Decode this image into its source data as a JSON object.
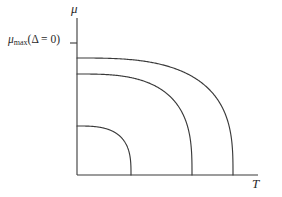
{
  "figure": {
    "background_color": "#ffffff",
    "line_color": "#3a3a3a"
  },
  "labels": {
    "y_axis": "μ",
    "x_axis": "T",
    "mu_max_symbol": "μ",
    "mu_max_subscript": "max",
    "mu_max_argument": "(Δ = 0)"
  },
  "chart_data": {
    "type": "line",
    "title": "",
    "xlabel": "T",
    "ylabel": "μ",
    "grid": false,
    "legend": null,
    "annotations": [
      {
        "text": "μ_max(Δ = 0)",
        "axis": "y",
        "value": 1.0,
        "tick": true
      }
    ],
    "axis": {
      "x_origin_px": 77,
      "y_origin_px": 175,
      "x_end_px": 258,
      "y_top_px": 18,
      "x_range": [
        0,
        1
      ],
      "y_range": [
        0,
        1
      ],
      "ticks_x": [],
      "ticks_y": [
        "μ_max(Δ = 0)"
      ]
    },
    "series": [
      {
        "name": "outer-phase-boundary",
        "shape": "superellipse-quarter",
        "y_intercept_px": 58,
        "x_intercept_px": 233,
        "exponent": 3.0,
        "points": [
          {
            "x": 0,
            "y": 0.745
          },
          {
            "x": 0.2,
            "y": 0.744
          },
          {
            "x": 0.4,
            "y": 0.736
          },
          {
            "x": 0.55,
            "y": 0.723
          },
          {
            "x": 0.7,
            "y": 0.693
          },
          {
            "x": 0.82,
            "y": 0.645
          },
          {
            "x": 0.9,
            "y": 0.585
          },
          {
            "x": 0.95,
            "y": 0.505
          },
          {
            "x": 0.98,
            "y": 0.4
          },
          {
            "x": 1.0,
            "y": 0.0
          }
        ]
      },
      {
        "name": "middle-phase-boundary",
        "shape": "superellipse-quarter",
        "y_intercept_px": 74,
        "x_intercept_px": 192,
        "exponent": 3.0,
        "points": [
          {
            "x": 0,
            "y": 0.643
          },
          {
            "x": 0.2,
            "y": 0.642
          },
          {
            "x": 0.4,
            "y": 0.634
          },
          {
            "x": 0.55,
            "y": 0.623
          },
          {
            "x": 0.7,
            "y": 0.598
          },
          {
            "x": 0.82,
            "y": 0.556
          },
          {
            "x": 0.9,
            "y": 0.505
          },
          {
            "x": 0.95,
            "y": 0.436
          },
          {
            "x": 0.98,
            "y": 0.345
          },
          {
            "x": 1.0,
            "y": 0.0
          }
        ]
      },
      {
        "name": "inner-phase-boundary",
        "shape": "superellipse-quarter",
        "y_intercept_px": 126,
        "x_intercept_px": 131,
        "exponent": 3.0,
        "points": [
          {
            "x": 0,
            "y": 0.312
          },
          {
            "x": 0.2,
            "y": 0.311
          },
          {
            "x": 0.4,
            "y": 0.308
          },
          {
            "x": 0.55,
            "y": 0.302
          },
          {
            "x": 0.7,
            "y": 0.29
          },
          {
            "x": 0.82,
            "y": 0.27
          },
          {
            "x": 0.9,
            "y": 0.245
          },
          {
            "x": 0.95,
            "y": 0.212
          },
          {
            "x": 0.98,
            "y": 0.167
          },
          {
            "x": 1.0,
            "y": 0.0
          }
        ]
      }
    ]
  }
}
